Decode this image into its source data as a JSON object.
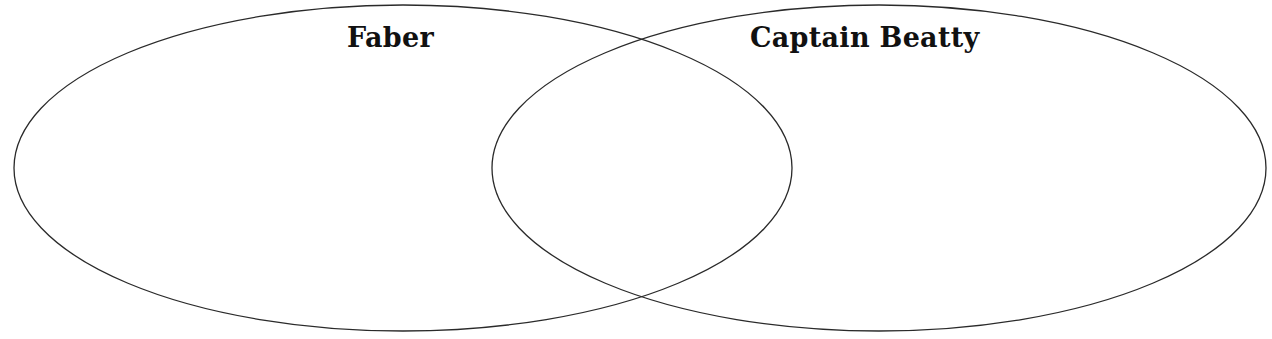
{
  "diagram": {
    "type": "venn",
    "stroke_color": "#2a2a2a",
    "background_color": "#ffffff",
    "sets": [
      {
        "label": "Faber",
        "cx": 403,
        "cy": 168,
        "rx": 389,
        "ry": 163
      },
      {
        "label": "Captain Beatty",
        "cx": 879,
        "cy": 168,
        "rx": 387,
        "ry": 163
      }
    ],
    "overlap_label": ""
  }
}
